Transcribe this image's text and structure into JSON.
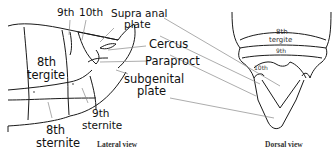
{
  "lateral_view": {
    "caption": "Lateral view",
    "labels": {
      "ninth": "9th",
      "tenth": "10th",
      "supra_anal_plate_line1": "Supra anal",
      "supra_anal_plate_line2": "plate",
      "cercus": "Cercus",
      "paraproct": "Paraproct",
      "subgenital_plate_line1": "subgenital",
      "subgenital_plate_line2": "plate",
      "eighth_tergite_line1": "8th",
      "eighth_tergite_line2": "tergite",
      "ninth_sternite_line1": "9th",
      "ninth_sternite_line2": "sternite",
      "eighth_sternite_line1": "8th",
      "eighth_sternite_line2": "sternite"
    }
  },
  "dorsal_view": {
    "caption": "Dorsal view",
    "labels": {
      "eighth_tergite_line1": "8th",
      "eighth_tergite_line2": "tergite",
      "ninth": "9th",
      "tenth": "10th"
    }
  },
  "colors": {
    "outline": "#1a1a1a",
    "leader_line": "#888888",
    "text": "#111111"
  }
}
